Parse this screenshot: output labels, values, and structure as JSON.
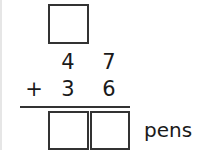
{
  "problem": {
    "regroup_box": "",
    "addend1": {
      "tens": "4",
      "ones": "7"
    },
    "addend2": {
      "operator": "+",
      "tens": "3",
      "ones": "6"
    },
    "answer": {
      "tens": "",
      "ones": ""
    },
    "unit": "pens"
  }
}
